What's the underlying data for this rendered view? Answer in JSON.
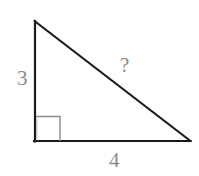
{
  "figure": {
    "kind": "right-triangle-diagram",
    "background_color": "#ffffff",
    "stroke_color": "#1a1a1a",
    "label_color": "#8c8c8c",
    "right_angle_marker_color": "#8c8c8c",
    "vertices": {
      "apex": {
        "x": 34,
        "y": 21
      },
      "bottom_left": {
        "x": 35,
        "y": 141
      },
      "bottom_right": {
        "x": 190,
        "y": 141
      }
    },
    "right_angle_marker": {
      "x": 36,
      "y": 116,
      "width": 24,
      "height": 25,
      "at_vertex": "bottom_left"
    },
    "labels": {
      "vertical_leg": "3",
      "hypotenuse": "?",
      "horizontal_leg": "4"
    }
  }
}
